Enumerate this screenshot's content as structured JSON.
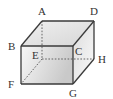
{
  "figure": {
    "type": "cube",
    "vertices": [
      "A",
      "B",
      "C",
      "D",
      "E",
      "F",
      "G",
      "H"
    ],
    "visible_edges": [
      "AB",
      "AD",
      "BC",
      "CD",
      "BF",
      "CG",
      "FG",
      "DH",
      "GH"
    ],
    "hidden_edges": [
      "AE",
      "EF",
      "EH"
    ],
    "labels": {
      "A": "A",
      "B": "B",
      "C": "C",
      "D": "D",
      "E": "E",
      "F": "F",
      "G": "G",
      "H": "H"
    },
    "colors": {
      "edge": "#3a3a3a",
      "front_face_light": "#f4f4f4",
      "front_face_dark": "#c8c8c8",
      "top_face": "#e6e6e6",
      "side_face": "#f2f2f2"
    }
  }
}
